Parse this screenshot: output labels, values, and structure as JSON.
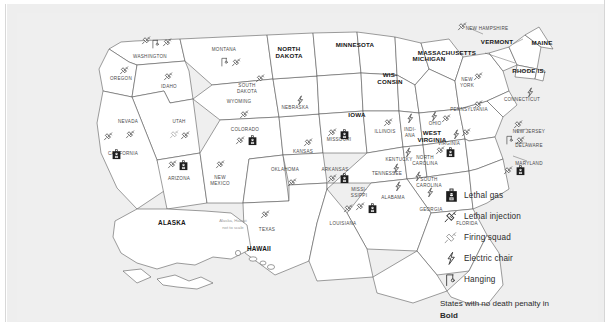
{
  "map": {
    "title_note": "Alaska, Hawaii\nnot to scale",
    "note_line1": "Alaska, Hawaii",
    "note_line2": "not to scale",
    "states": [
      {
        "code": "WA",
        "label": "WASHINGTON",
        "bold": false,
        "methods": [
          "lethal-injection",
          "hanging",
          "lethal-injection"
        ]
      },
      {
        "code": "OR",
        "label": "OREGON",
        "bold": false,
        "methods": [
          "lethal-injection"
        ]
      },
      {
        "code": "ID",
        "label": "IDAHO",
        "bold": false,
        "methods": [
          "lethal-injection",
          "firing-squad"
        ]
      },
      {
        "code": "MT",
        "label": "MONTANA",
        "bold": false,
        "methods": [
          "hanging",
          "lethal-injection"
        ]
      },
      {
        "code": "WY",
        "label": "WYOMING",
        "bold": false,
        "methods": [
          "lethal-injection"
        ]
      },
      {
        "code": "NV",
        "label": "NEVADA",
        "bold": false,
        "methods": [
          "lethal-injection"
        ]
      },
      {
        "code": "UT",
        "label": "UTAH",
        "bold": false,
        "methods": [
          "firing-squad",
          "lethal-injection"
        ]
      },
      {
        "code": "CO",
        "label": "COLORADO",
        "bold": false,
        "methods": [
          "lethal-injection",
          "lethal-gas"
        ]
      },
      {
        "code": "CA",
        "label": "CALIFORNIA",
        "bold": false,
        "methods": [
          "lethal-injection",
          "lethal-gas"
        ]
      },
      {
        "code": "AZ",
        "label": "ARIZONA",
        "bold": false,
        "methods": [
          "lethal-injection",
          "lethal-gas"
        ]
      },
      {
        "code": "NM",
        "label": "NEW MEXICO",
        "bold": false,
        "methods": [
          "lethal-injection"
        ]
      },
      {
        "code": "ND",
        "label": "NORTH DAKOTA",
        "bold": true,
        "methods": []
      },
      {
        "code": "SD",
        "label": "SOUTH DAKOTA",
        "bold": false,
        "methods": [
          "lethal-injection"
        ]
      },
      {
        "code": "NE",
        "label": "NEBRASKA",
        "bold": false,
        "methods": [
          "electric-chair"
        ]
      },
      {
        "code": "KS",
        "label": "KANSAS",
        "bold": false,
        "methods": [
          "lethal-injection"
        ]
      },
      {
        "code": "OK",
        "label": "OKLAHOMA",
        "bold": false,
        "methods": [
          "lethal-injection"
        ]
      },
      {
        "code": "TX",
        "label": "TEXAS",
        "bold": false,
        "methods": [
          "lethal-injection"
        ]
      },
      {
        "code": "MN",
        "label": "MINNESOTA",
        "bold": true,
        "methods": []
      },
      {
        "code": "IA",
        "label": "IOWA",
        "bold": true,
        "methods": []
      },
      {
        "code": "MO",
        "label": "MISSOURI",
        "bold": false,
        "methods": [
          "lethal-injection",
          "lethal-gas"
        ]
      },
      {
        "code": "AR",
        "label": "ARKANSAS",
        "bold": false,
        "methods": [
          "lethal-injection",
          "lethal-gas"
        ]
      },
      {
        "code": "LA",
        "label": "LOUISIANA",
        "bold": false,
        "methods": [
          "lethal-injection"
        ]
      },
      {
        "code": "WI",
        "label": "WIS-CONSIN",
        "bold": true,
        "methods": []
      },
      {
        "code": "MI",
        "label": "MICHIGAN",
        "bold": true,
        "methods": []
      },
      {
        "code": "IL",
        "label": "ILLINOIS",
        "bold": false,
        "methods": [
          "lethal-injection"
        ]
      },
      {
        "code": "IN",
        "label": "INDI-ANA",
        "bold": false,
        "methods": [
          "electric-chair",
          "lethal-injection"
        ]
      },
      {
        "code": "OH",
        "label": "OHIO",
        "bold": false,
        "methods": [
          "electric-chair",
          "lethal-injection"
        ]
      },
      {
        "code": "KY",
        "label": "KENTUCKY",
        "bold": false,
        "methods": [
          "electric-chair"
        ]
      },
      {
        "code": "TN",
        "label": "TENNESSEE",
        "bold": false,
        "methods": [
          "electric-chair"
        ]
      },
      {
        "code": "MS",
        "label": "MISSI-SSIPPI",
        "bold": false,
        "methods": [
          "lethal-injection",
          "lethal-gas"
        ]
      },
      {
        "code": "AL",
        "label": "ALABAMA",
        "bold": false,
        "methods": [
          "electric-chair"
        ]
      },
      {
        "code": "GA",
        "label": "GEORGIA",
        "bold": false,
        "methods": [
          "electric-chair"
        ]
      },
      {
        "code": "FL",
        "label": "FLORIDA",
        "bold": false,
        "methods": [
          "electric-chair"
        ]
      },
      {
        "code": "SC",
        "label": "SOUTH CAROLINA",
        "bold": false,
        "methods": [
          "electric-chair",
          "lethal-injection"
        ]
      },
      {
        "code": "NC",
        "label": "NORTH CAROLINA",
        "bold": false,
        "methods": [
          "lethal-injection",
          "lethal-gas"
        ]
      },
      {
        "code": "VA",
        "label": "VIRGINIA",
        "bold": false,
        "methods": [
          "electric-chair",
          "lethal-injection"
        ]
      },
      {
        "code": "WV",
        "label": "WEST VIRGINIA",
        "bold": true,
        "methods": []
      },
      {
        "code": "PA",
        "label": "PENNSYLVANIA",
        "bold": false,
        "methods": [
          "lethal-injection"
        ]
      },
      {
        "code": "NY",
        "label": "NEW YORK",
        "bold": false,
        "methods": [
          "lethal-injection"
        ]
      },
      {
        "code": "NJ",
        "label": "NEW JERSEY",
        "bold": false,
        "methods": [
          "lethal-injection"
        ]
      },
      {
        "code": "DE",
        "label": "DELAWARE",
        "bold": false,
        "methods": [
          "hanging",
          "lethal-injection"
        ]
      },
      {
        "code": "MD",
        "label": "MARYLAND",
        "bold": false,
        "methods": [
          "lethal-injection",
          "lethal-gas"
        ]
      },
      {
        "code": "CT",
        "label": "CONNECTICUT",
        "bold": false,
        "methods": [
          "electric-chair"
        ]
      },
      {
        "code": "RI",
        "label": "RHODE IS.",
        "bold": true,
        "methods": []
      },
      {
        "code": "MA",
        "label": "MASSACHUSETTS",
        "bold": true,
        "methods": []
      },
      {
        "code": "VT",
        "label": "VERMONT",
        "bold": true,
        "methods": []
      },
      {
        "code": "NH",
        "label": "NEW HAMPSHIRE",
        "bold": false,
        "methods": [
          "lethal-injection"
        ]
      },
      {
        "code": "ME",
        "label": "MAINE",
        "bold": true,
        "methods": []
      },
      {
        "code": "AK",
        "label": "ALASKA",
        "bold": true,
        "methods": []
      },
      {
        "code": "HI",
        "label": "HAWAII",
        "bold": true,
        "methods": []
      }
    ]
  },
  "legend": {
    "items": [
      {
        "icon": "lethal-gas",
        "label": "Lethal gas"
      },
      {
        "icon": "lethal-injection",
        "label": "Lethal injection"
      },
      {
        "icon": "firing-squad",
        "label": "Firing squad"
      },
      {
        "icon": "electric-chair",
        "label": "Electric chair"
      },
      {
        "icon": "hanging",
        "label": "Hanging"
      }
    ],
    "note_prefix": "States with no death penalty in ",
    "note_bold": "Bold"
  }
}
